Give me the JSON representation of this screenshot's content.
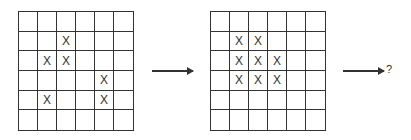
{
  "diagram": {
    "type": "grid-sequence-puzzle",
    "rows": 6,
    "cols": 6,
    "mark_symbol": "X",
    "line_color": "#333333",
    "grids": [
      {
        "id": "grid-1",
        "marks": [
          [
            1,
            2
          ],
          [
            2,
            1
          ],
          [
            2,
            2
          ],
          [
            3,
            4
          ],
          [
            4,
            1
          ],
          [
            4,
            4
          ]
        ]
      },
      {
        "id": "grid-2",
        "marks": [
          [
            1,
            1
          ],
          [
            1,
            2
          ],
          [
            2,
            1
          ],
          [
            2,
            2
          ],
          [
            2,
            3
          ],
          [
            3,
            1
          ],
          [
            3,
            2
          ],
          [
            3,
            3
          ]
        ]
      }
    ],
    "arrows": [
      {
        "id": "arrow-1",
        "label": ""
      },
      {
        "id": "arrow-2",
        "label": "?"
      }
    ]
  }
}
